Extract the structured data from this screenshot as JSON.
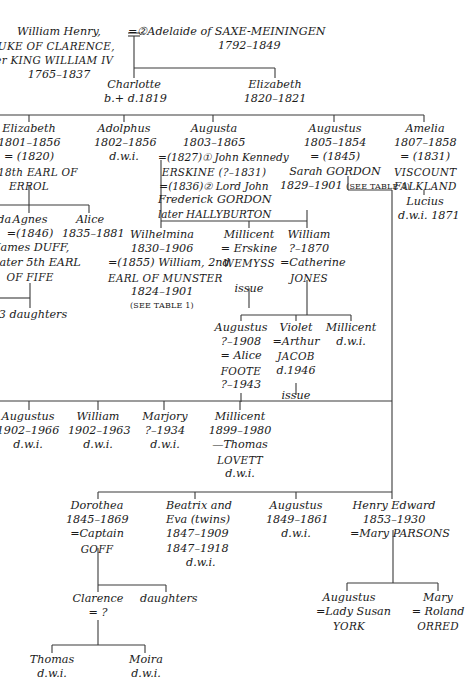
{
  "diagram": {
    "type": "family-tree",
    "line_color": "#3a3a3a",
    "text_color": "#1a1a1a"
  },
  "generation_0": {
    "william_henry": {
      "name": "William Henry,",
      "title1": "DUKE OF CLARENCE,",
      "title2": "later KING WILLIAM IV",
      "dates": "1765–1837"
    },
    "adelaide": {
      "marriage": "=②Adelaide of SAXE-MEININGEN",
      "dates": "1792–1849"
    }
  },
  "generation_1": {
    "charlotte": {
      "name": "Charlotte",
      "dates": "b.+ d.1819"
    },
    "elizabeth": {
      "name": "Elizabeth",
      "dates": "1820–1821"
    }
  },
  "generation_2": {
    "elizabeth": {
      "name": "Elizabeth",
      "dates": "1801–1856",
      "marriage": "= (1820)",
      "spouse1": "18th EARL OF",
      "spouse2": "ERROL"
    },
    "adolphus": {
      "name": "Adolphus",
      "dates": "1802–1856",
      "note": "d.w.i."
    },
    "augusta": {
      "name": "Augusta",
      "dates": "1803–1865",
      "m1": "=(1827)① John Kennedy",
      "m1b": "ERSKINE (?–1831)",
      "m2": "=(1836)② Lord John",
      "m2b": "Frederick GORDON",
      "m2c": "later HALLYBURTON"
    },
    "augustus": {
      "name": "Augustus",
      "dates": "1805–1854",
      "marriage": "= (1845)",
      "spouse": "Sarah GORDON",
      "spouse_dates": "1829–1901",
      "ref": "(SEE TABLE 1)"
    },
    "amelia": {
      "name": "Amelia",
      "dates": "1807–1858",
      "marriage": "= (1831)",
      "spouse1": "VISCOUNT",
      "spouse2": "FALKLAND"
    }
  },
  "generation_3": {
    "ida": {
      "name": "Ida"
    },
    "agnes": {
      "name": "Agnes",
      "marriage": "=(1846)",
      "spouse1": "James DUFF,",
      "spouse2": "later 5th EARL",
      "spouse3": "OF FIFE"
    },
    "alice": {
      "name": "Alice",
      "dates": "1835–1881"
    },
    "wilhelmina": {
      "name": "Wilhelmina",
      "dates": "1830–1906",
      "marriage": "=(1855) William, 2nd",
      "spouse1": "EARL OF MUNSTER",
      "spouse_dates": "1824–1901",
      "ref": "(SEE TABLE 1)"
    },
    "millicent": {
      "name": "Millicent",
      "spouse1": "= Erskine",
      "spouse2": "WEMYSS",
      "issue": "issue"
    },
    "william": {
      "name": "William",
      "dates": "?–1870",
      "spouse1": "=Catherine",
      "spouse2": "JONES"
    },
    "lucius": {
      "name": "Lucius",
      "note": "d.w.i. 1871"
    },
    "three_daughters": {
      "name": "3 daughters"
    }
  },
  "generation_4": {
    "augustus": {
      "name": "Augustus",
      "dates": "?–1908",
      "spouse1": "= Alice",
      "spouse2": "FOOTE",
      "spouse_dates": "?–1943"
    },
    "violet": {
      "name": "Violet",
      "spouse1": "=Arthur",
      "spouse2": "JACOB",
      "spouse_dates": "d.1946",
      "issue": "issue"
    },
    "millicent": {
      "name": "Millicent",
      "note": "d.w.i."
    }
  },
  "generation_5": {
    "augustus": {
      "name": "Augustus",
      "dates": "1902–1966",
      "note": "d.w.i."
    },
    "william": {
      "name": "William",
      "dates": "1902–1963",
      "note": "d.w.i."
    },
    "marjory": {
      "name": "Marjory",
      "dates": "?–1934",
      "note": "d.w.i."
    },
    "millicent": {
      "name": "Millicent",
      "dates": "1899–1980",
      "spouse1": "—Thomas",
      "spouse2": "LOVETT",
      "note": "d.w.i."
    }
  },
  "generation_6": {
    "dorothea": {
      "name": "Dorothea",
      "dates": "1845–1869",
      "spouse1": "=Captain",
      "spouse2": "GOFF"
    },
    "beatrix_eva": {
      "name": "Beatrix and",
      "name2": "Eva (twins)",
      "dates1": "1847–1909",
      "dates2": "1847–1918",
      "note": "d.w.i."
    },
    "augustus": {
      "name": "Augustus",
      "dates": "1849–1861",
      "note": "d.w.i."
    },
    "henry_edward": {
      "name": "Henry Edward",
      "dates": "1853–1930",
      "spouse": "=Mary PARSONS"
    }
  },
  "generation_7": {
    "clarence": {
      "name": "Clarence",
      "spouse": "= ?"
    },
    "daughters": {
      "name": "daughters"
    },
    "augustus": {
      "name": "Augustus",
      "spouse1": "=Lady Susan",
      "spouse2": "YORK"
    },
    "mary": {
      "name": "Mary",
      "spouse1": "= Roland",
      "spouse2": "ORRED"
    }
  },
  "generation_8": {
    "thomas": {
      "name": "Thomas",
      "note": "d.w.i."
    },
    "moira": {
      "name": "Moira",
      "note": "d.w.i."
    }
  }
}
